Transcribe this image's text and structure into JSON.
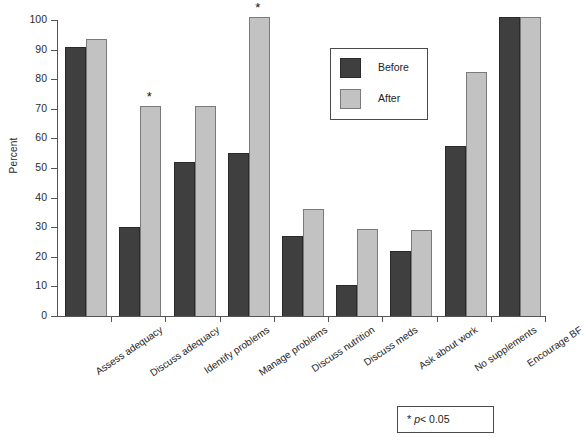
{
  "chart_data": {
    "type": "bar",
    "title": "",
    "subtitle": "",
    "xlabel": "",
    "ylabel": "Percent",
    "ylim": [
      0,
      100
    ],
    "ytick_step": 10,
    "yticks": [
      0,
      10,
      20,
      30,
      40,
      50,
      60,
      70,
      80,
      90,
      100
    ],
    "ytick_labels": [
      "0",
      "10",
      "20",
      "30",
      "40",
      "50",
      "60",
      "70",
      "80",
      "90",
      "100"
    ],
    "grid": false,
    "legend_position": "upper center-right",
    "categories": [
      "Assess adequacy",
      "Discuss adequacy",
      "Identify problems",
      "Manage problems",
      "Discuss nutrition",
      "Discuss meds",
      "Ask about work",
      "No supplements",
      "Encourage BF"
    ],
    "series": [
      {
        "name": "Before",
        "color": "#3f3f3f",
        "values": [
          91,
          30,
          52,
          55,
          27,
          10.5,
          22,
          57.5,
          101
        ]
      },
      {
        "name": "After",
        "color": "#c2c2c2",
        "values": [
          93.5,
          71,
          71,
          101,
          36,
          29.5,
          29,
          82.5,
          101
        ]
      }
    ],
    "annotations": [
      {
        "symbol": "*",
        "category": "Discuss adequacy",
        "series": "After",
        "value": 71
      },
      {
        "symbol": "*",
        "category": "Manage problems",
        "series": "After",
        "value": 101
      }
    ],
    "footnote": {
      "symbol": "*",
      "statistic": "p",
      "comparison": "< 0.05",
      "text": "* p< 0.05"
    }
  },
  "legend": {
    "entries": [
      {
        "label": "Before"
      },
      {
        "label": "After"
      }
    ]
  }
}
